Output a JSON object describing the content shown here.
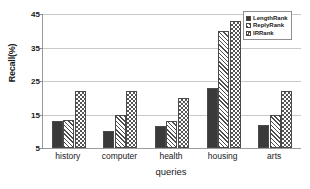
{
  "chart_data": {
    "type": "bar",
    "title": "",
    "xlabel": "queries",
    "ylabel": "Recall(%)",
    "categories": [
      "history",
      "computer",
      "health",
      "housing",
      "arts"
    ],
    "series": [
      {
        "name": "LengthRank",
        "values": [
          13,
          10,
          11.5,
          23,
          12
        ]
      },
      {
        "name": "ReplyRank",
        "values": [
          13.5,
          15,
          13,
          40,
          15
        ]
      },
      {
        "name": "IRRank",
        "values": [
          22,
          22,
          20,
          43,
          22
        ]
      }
    ],
    "ylim": [
      5,
      45
    ],
    "yticks": [
      5,
      15,
      25,
      35,
      45
    ],
    "ytick_labels": [
      "5",
      "15",
      "25",
      "35",
      "45"
    ],
    "grid": true,
    "legend_position": "top-right"
  },
  "legend": {
    "items": [
      {
        "label": "LengthRank",
        "swatch": "solid-dark",
        "color": "#3a3a3a"
      },
      {
        "label": "ReplyRank",
        "swatch": "diagonal-hatch",
        "color": "#4d4d4d"
      },
      {
        "label": "IRRank",
        "swatch": "checker-hatch",
        "color": "#555555"
      }
    ]
  },
  "axes": {
    "y_title": "Recall(%)",
    "x_title": "queries",
    "axis_color": "#9a9a9a",
    "gridline_color": "#c9c9c9"
  }
}
